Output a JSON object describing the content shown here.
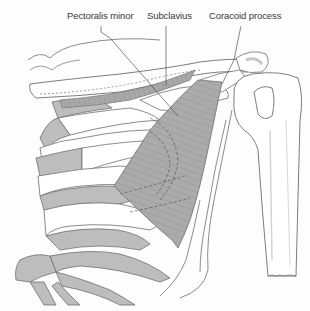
{
  "diagram": {
    "labels": [
      {
        "id": "pectoralis-minor",
        "text": "Pectoralis minor",
        "x": 67,
        "y": 15
      },
      {
        "id": "subclavius",
        "text": "Subclavius",
        "x": 148,
        "y": 15
      },
      {
        "id": "coracoid-process",
        "text": "Coracoid process",
        "x": 209,
        "y": 15
      }
    ],
    "colors": {
      "bone_fill": "#ffffff",
      "outline": "#6e6e6e",
      "cartilage_fill": "#bdbdbd",
      "muscle_fill": "#a9a9a9",
      "muscle_fibres": "#8a8a8a",
      "leader_line": "#555555",
      "label_text": "#3a3a3a"
    },
    "structures": [
      "clavicle",
      "first rib",
      "ribs 2-6",
      "costal cartilages",
      "sternum (partial)",
      "scapula (partial)",
      "coracoid process",
      "acromion",
      "humerus",
      "subclavius muscle",
      "pectoralis minor muscle"
    ]
  }
}
